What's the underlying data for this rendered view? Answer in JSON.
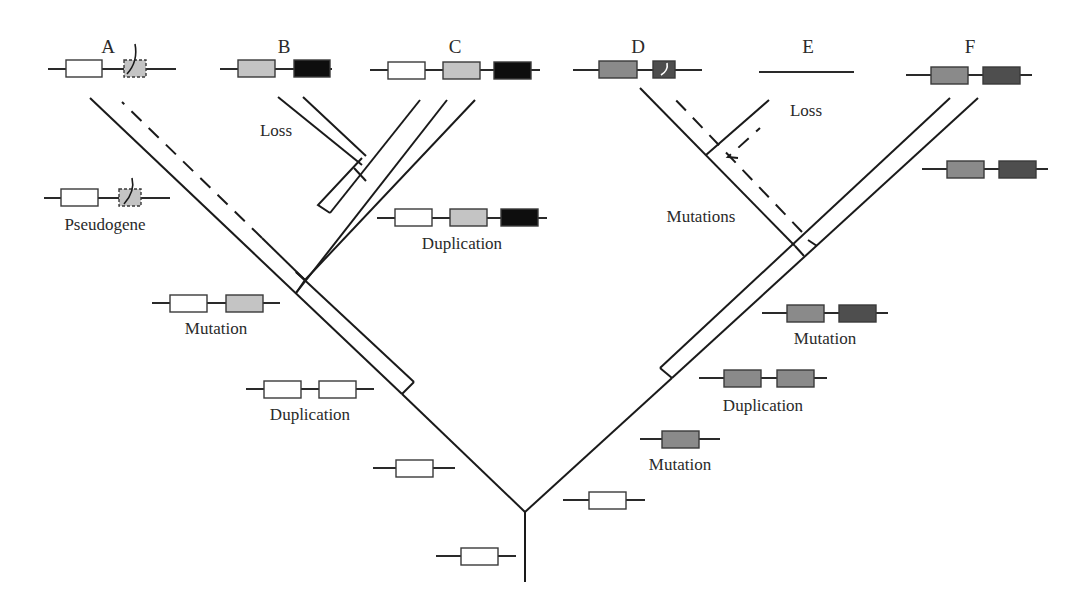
{
  "diagram": {
    "type": "gene-family-evolution-tree",
    "colors": {
      "white_gene": "#ffffff",
      "light_gray_gene": "#c4c4c4",
      "black_gene": "#0e0e0e",
      "mid_gray_gene": "#8a8a8a",
      "dark_gray_gene": "#4e4e4e",
      "line": "#1a1a1a"
    },
    "taxa": [
      {
        "id": "A",
        "label": "A",
        "genes": [
          "white",
          "light-gray-pseudogene"
        ]
      },
      {
        "id": "B",
        "label": "B",
        "genes": [
          "light-gray",
          "black"
        ]
      },
      {
        "id": "C",
        "label": "C",
        "genes": [
          "white",
          "light-gray",
          "black"
        ]
      },
      {
        "id": "D",
        "label": "D",
        "genes": [
          "mid-gray",
          "dark-gray-mutated"
        ]
      },
      {
        "id": "E",
        "label": "E",
        "genes": []
      },
      {
        "id": "F",
        "label": "F",
        "genes": [
          "mid-gray",
          "dark-gray"
        ]
      }
    ],
    "events": {
      "pseudogene": "Pseudogene",
      "loss_left": "Loss",
      "duplication_left_upper": "Duplication",
      "mutation_left": "Mutation",
      "duplication_left_lower": "Duplication",
      "loss_right": "Loss",
      "mutations_right": "Mutations",
      "mutation_right_upper": "Mutation",
      "duplication_right": "Duplication",
      "mutation_right_lower": "Mutation"
    }
  }
}
